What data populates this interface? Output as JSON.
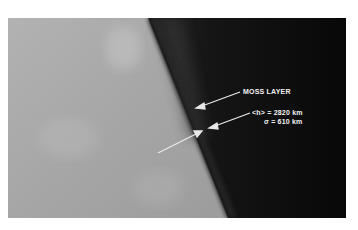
{
  "figure": {
    "annotations": {
      "moss_layer": "MOSS LAYER",
      "mean_height": "<h> = 2820 km",
      "sigma": "σ = 610 km"
    },
    "colors": {
      "disk": "#a9a9a9",
      "corona_near": "#4a4a4a",
      "corona_far": "#0c0c0c",
      "limb": "#1e1e1e",
      "annotation": "#f2f2f2"
    }
  }
}
